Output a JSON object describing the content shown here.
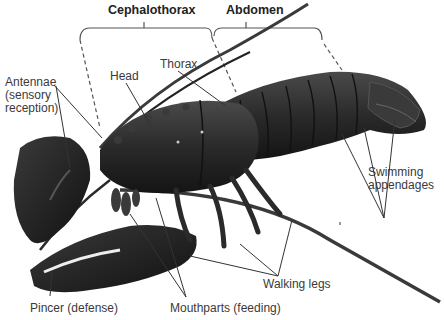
{
  "diagram": {
    "groups": [
      {
        "id": "cephalothorax",
        "label": "Cephalothorax"
      },
      {
        "id": "abdomen",
        "label": "Abdomen"
      }
    ],
    "labels": {
      "antennae": "Antennae\n(sensory\nreception)",
      "head": "Head",
      "thorax": "Thorax",
      "swimming": "Swimming\nappendages",
      "walking": "Walking legs",
      "pincer": "Pincer (defense)",
      "mouthparts": "Mouthparts (feeding)"
    },
    "colors": {
      "body": "#2b2b2b",
      "body_dark": "#151515",
      "body_light": "#4a4a4a",
      "leader_line": "#333333",
      "text": "#3a3a3a"
    }
  }
}
